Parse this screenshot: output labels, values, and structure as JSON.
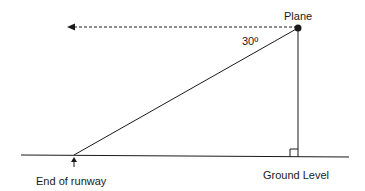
{
  "diagram": {
    "labels": {
      "plane": "Plane",
      "angle": "30º",
      "ground": "Ground Level",
      "runway": "End of runway"
    },
    "angle_degrees": 30,
    "colors": {
      "line": "#1a1a1a",
      "background": "#ffffff"
    }
  }
}
